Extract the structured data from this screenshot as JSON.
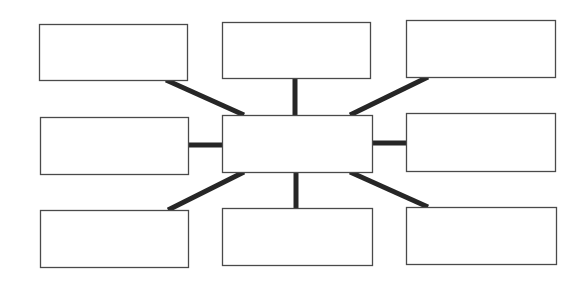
{
  "diagram": {
    "type": "spider-map",
    "canvas": {
      "width": 584,
      "height": 283,
      "background": "#ffffff"
    },
    "style": {
      "box_border": "#4a4a4a",
      "connector_color": "#262626",
      "connector_width": 5
    },
    "center": {
      "id": "center",
      "label": "",
      "x": 222,
      "y": 115,
      "w": 150,
      "h": 57
    },
    "nodes": [
      {
        "id": "top-left",
        "label": "",
        "x": 39,
        "y": 24,
        "w": 148,
        "h": 56
      },
      {
        "id": "top-center",
        "label": "",
        "x": 222,
        "y": 22,
        "w": 148,
        "h": 56
      },
      {
        "id": "top-right",
        "label": "",
        "x": 406,
        "y": 20,
        "w": 149,
        "h": 57
      },
      {
        "id": "middle-left",
        "label": "",
        "x": 40,
        "y": 117,
        "w": 148,
        "h": 57
      },
      {
        "id": "middle-right",
        "label": "",
        "x": 406,
        "y": 113,
        "w": 149,
        "h": 58
      },
      {
        "id": "bottom-left",
        "label": "",
        "x": 40,
        "y": 210,
        "w": 148,
        "h": 57
      },
      {
        "id": "bottom-center",
        "label": "",
        "x": 222,
        "y": 208,
        "w": 150,
        "h": 57
      },
      {
        "id": "bottom-right",
        "label": "",
        "x": 406,
        "y": 207,
        "w": 150,
        "h": 57
      }
    ],
    "connectors": [
      {
        "from": "top-left",
        "to": "center",
        "x1": 166,
        "y1": 80,
        "x2": 244,
        "y2": 115
      },
      {
        "from": "top-center",
        "to": "center",
        "x1": 295,
        "y1": 78,
        "x2": 295,
        "y2": 115
      },
      {
        "from": "top-right",
        "to": "center",
        "x1": 428,
        "y1": 77,
        "x2": 350,
        "y2": 115
      },
      {
        "from": "middle-left",
        "to": "center",
        "x1": 188,
        "y1": 145,
        "x2": 222,
        "y2": 145
      },
      {
        "from": "middle-right",
        "to": "center",
        "x1": 406,
        "y1": 143,
        "x2": 372,
        "y2": 143
      },
      {
        "from": "bottom-left",
        "to": "center",
        "x1": 168,
        "y1": 210,
        "x2": 244,
        "y2": 172
      },
      {
        "from": "bottom-center",
        "to": "center",
        "x1": 296,
        "y1": 208,
        "x2": 296,
        "y2": 172
      },
      {
        "from": "bottom-right",
        "to": "center",
        "x1": 428,
        "y1": 207,
        "x2": 350,
        "y2": 172
      }
    ]
  }
}
